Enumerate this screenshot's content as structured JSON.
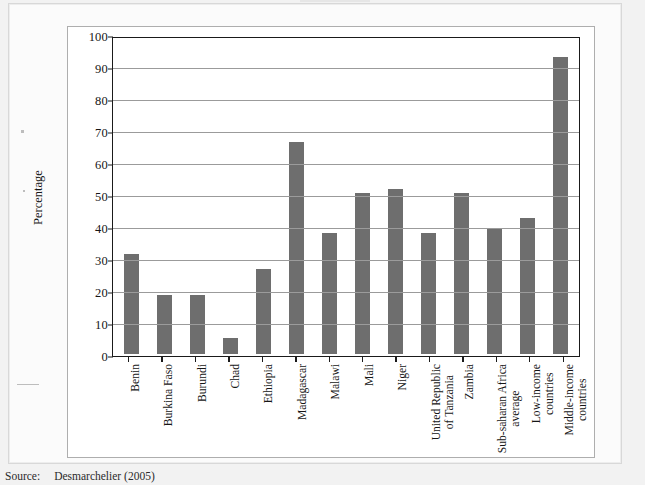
{
  "figure": {
    "source_label": "Source:",
    "source_text": "Desmarchelier (2005)"
  },
  "chart_data": {
    "type": "bar",
    "title": "",
    "xlabel": "",
    "ylabel": "Percentage",
    "ylim": [
      0,
      100
    ],
    "ytick_step": 10,
    "grid": true,
    "legend": "none",
    "bar_color": "#6e6e6e",
    "yticks": [
      "0",
      "10",
      "20",
      "30",
      "40",
      "50",
      "60",
      "70",
      "80",
      "90",
      "100"
    ],
    "categories": [
      "Benin",
      "Burkina Faso",
      "Burundi",
      "Chad",
      "Ethiopia",
      "Madagascar",
      "Malawi",
      "Mali",
      "Niger",
      "United Republic of Tanzania",
      "Zambia",
      "Sub-saharan Africa average",
      "Low-income countries",
      "Middle-income countries"
    ],
    "category_lines": [
      [
        "Benin"
      ],
      [
        "Burkina Faso"
      ],
      [
        "Burundi"
      ],
      [
        "Chad"
      ],
      [
        "Ethiopia"
      ],
      [
        "Madagascar"
      ],
      [
        "Malawi"
      ],
      [
        "Mali"
      ],
      [
        "Niger"
      ],
      [
        "United Republic",
        "of Tanzania"
      ],
      [
        "Zambia"
      ],
      [
        "Sub-saharan Africa",
        "average"
      ],
      [
        "Low-income",
        "countries"
      ],
      [
        "Middle-income",
        "countries"
      ]
    ],
    "values": [
      31.6,
      18.9,
      18.9,
      5.1,
      27.1,
      67.0,
      38.2,
      51.1,
      52.2,
      38.2,
      51.1,
      39.7,
      43.2,
      94.0
    ]
  }
}
